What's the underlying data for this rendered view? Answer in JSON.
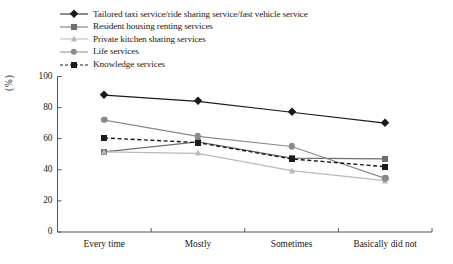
{
  "chart_data": {
    "type": "line",
    "title": "",
    "xlabel": "",
    "ylabel": "(%)",
    "categories": [
      "Every time",
      "Mostly",
      "Sometimes",
      "Basically did not"
    ],
    "ylim": [
      0,
      100
    ],
    "yticks": [
      0,
      20,
      40,
      60,
      80,
      100
    ],
    "grid": false,
    "legend_position": "top-left",
    "series": [
      {
        "name": "Tailored taxi service/ride sharing service/fast vehicle service",
        "marker": "diamond",
        "linestyle": "solid",
        "color": "#1a1a1a",
        "values": [
          88,
          84,
          77,
          70
        ]
      },
      {
        "name": "Resident housing renting services",
        "marker": "square",
        "linestyle": "solid",
        "color": "#6e6e6e",
        "values": [
          51.5,
          58,
          47.5,
          47
        ]
      },
      {
        "name": "Private kitchen sharing services",
        "marker": "triangle",
        "linestyle": "solid",
        "color": "#b9b9b9",
        "values": [
          51.5,
          50.5,
          39.5,
          33
        ]
      },
      {
        "name": "Life services",
        "marker": "circle",
        "linestyle": "solid",
        "color": "#8a8a8a",
        "values": [
          72,
          61.5,
          55,
          34.5
        ]
      },
      {
        "name": "Knowledge services",
        "marker": "square",
        "linestyle": "dashed",
        "color": "#1a1a1a",
        "values": [
          60.5,
          57.5,
          47,
          42
        ]
      }
    ]
  },
  "axis": {
    "y_tick_labels": [
      "0",
      "20",
      "40",
      "60",
      "80",
      "100"
    ],
    "y_axis_title": "(%)",
    "x_tick_labels": [
      "Every time",
      "Mostly",
      "Sometimes",
      "Basically did not"
    ]
  }
}
